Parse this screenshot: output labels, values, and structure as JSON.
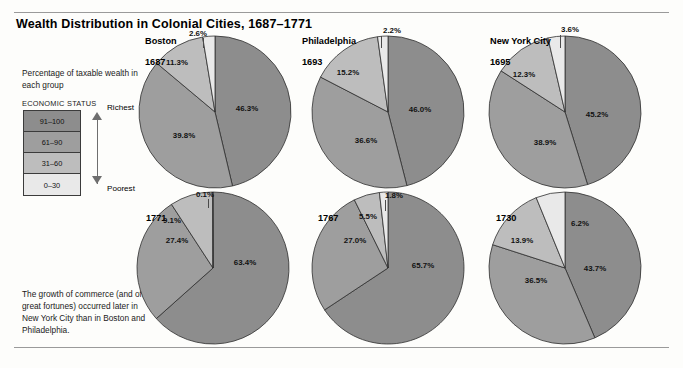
{
  "figure": {
    "title": "Wealth Distribution in Colonial Cities, 1687–1771",
    "key_caption": "Percentage of taxable wealth in each group",
    "key_heading": "ECONOMIC STATUS",
    "axis_top_label": "Richest",
    "axis_bottom_label": "Poorest",
    "footnote": "The growth of commerce (and of great fortunes) occurred later in New York City than in Boston and Philadelphia."
  },
  "legend": {
    "tiers": [
      {
        "label": "91–100",
        "color": "#8d8d8d"
      },
      {
        "label": "61–90",
        "color": "#9e9e9e"
      },
      {
        "label": "31–60",
        "color": "#bdbdbd"
      },
      {
        "label": "0–30",
        "color": "#e9e9e9"
      }
    ]
  },
  "chart_data": [
    {
      "type": "pie",
      "title": "Boston",
      "subtitle": "1687",
      "city": "Boston",
      "year": "1687",
      "categories": [
        "91–100",
        "61–90",
        "31–60",
        "0–30"
      ],
      "values": [
        46.3,
        39.8,
        11.3,
        2.6
      ],
      "labels": [
        "46.3%",
        "39.8%",
        "11.3%",
        "2.6%"
      ],
      "colors": [
        "#8d8d8d",
        "#9e9e9e",
        "#bdbdbd",
        "#e9e9e9"
      ]
    },
    {
      "type": "pie",
      "title": "Philadelphia",
      "subtitle": "1693",
      "city": "Philadelphia",
      "year": "1693",
      "categories": [
        "91–100",
        "61–90",
        "31–60",
        "0–30"
      ],
      "values": [
        46.0,
        36.6,
        15.2,
        2.2
      ],
      "labels": [
        "46.0%",
        "36.6%",
        "15.2%",
        "2.2%"
      ],
      "colors": [
        "#8d8d8d",
        "#9e9e9e",
        "#bdbdbd",
        "#e9e9e9"
      ]
    },
    {
      "type": "pie",
      "title": "New York City",
      "subtitle": "1695",
      "city": "New York City",
      "year": "1695",
      "categories": [
        "91–100",
        "61–90",
        "31–60",
        "0–30"
      ],
      "values": [
        45.2,
        38.9,
        12.3,
        3.6
      ],
      "labels": [
        "45.2%",
        "38.9%",
        "12.3%",
        "3.6%"
      ],
      "colors": [
        "#8d8d8d",
        "#9e9e9e",
        "#bdbdbd",
        "#e9e9e9"
      ]
    },
    {
      "type": "pie",
      "title": "Boston",
      "subtitle": "1771",
      "city": "",
      "year": "1771",
      "categories": [
        "91–100",
        "61–90",
        "31–60",
        "0–30"
      ],
      "values": [
        63.4,
        27.4,
        9.1,
        0.1
      ],
      "labels": [
        "63.4%",
        "27.4%",
        "9.1%",
        "0.1%"
      ],
      "colors": [
        "#8d8d8d",
        "#9e9e9e",
        "#bdbdbd",
        "#e9e9e9"
      ]
    },
    {
      "type": "pie",
      "title": "Philadelphia",
      "subtitle": "1767",
      "city": "",
      "year": "1767",
      "categories": [
        "91–100",
        "61–90",
        "31–60",
        "0–30"
      ],
      "values": [
        65.7,
        27.0,
        5.5,
        1.8
      ],
      "labels": [
        "65.7%",
        "27.0%",
        "5.5%",
        "1.8%"
      ],
      "colors": [
        "#8d8d8d",
        "#9e9e9e",
        "#bdbdbd",
        "#e9e9e9"
      ]
    },
    {
      "type": "pie",
      "title": "New York City",
      "subtitle": "1730",
      "city": "",
      "year": "1730",
      "categories": [
        "91–100",
        "61–90",
        "31–60",
        "0–30"
      ],
      "values": [
        43.7,
        36.5,
        13.9,
        6.2
      ],
      "labels": [
        "43.7%",
        "36.5%",
        "13.9%",
        "6.2%"
      ],
      "colors": [
        "#8d8d8d",
        "#9e9e9e",
        "#bdbdbd",
        "#e9e9e9"
      ]
    }
  ],
  "layout": {
    "pies": [
      {
        "cx": 215,
        "cy": 112,
        "r": 76,
        "start_angle": 0,
        "city_pos": [
          145,
          36
        ],
        "year_pos": [
          145,
          57
        ],
        "label_pos": [
          [
            247,
            108
          ],
          [
            184,
            135
          ],
          [
            177,
            62
          ],
          [
            198,
            33
          ]
        ],
        "leader": {
          "x": 203,
          "y": 38,
          "h": 10
        }
      },
      {
        "cx": 388,
        "cy": 112,
        "r": 76,
        "start_angle": 0,
        "city_pos": [
          302,
          36
        ],
        "year_pos": [
          302,
          57
        ],
        "label_pos": [
          [
            420,
            109
          ],
          [
            366,
            140
          ],
          [
            348,
            72
          ],
          [
            392,
            30
          ]
        ],
        "leader": {
          "x": 381,
          "y": 36,
          "h": 12
        }
      },
      {
        "cx": 565,
        "cy": 112,
        "r": 76,
        "start_angle": 0,
        "city_pos": [
          490,
          36
        ],
        "year_pos": [
          490,
          57
        ],
        "label_pos": [
          [
            597,
            114
          ],
          [
            545,
            142
          ],
          [
            524,
            74
          ],
          [
            570,
            29
          ]
        ],
        "leader": {
          "x": 560,
          "y": 35,
          "h": 13
        }
      },
      {
        "cx": 213,
        "cy": 268,
        "r": 76,
        "start_angle": 0,
        "city_pos": [
          143,
          196
        ],
        "year_pos": [
          146,
          213
        ],
        "label_pos": [
          [
            245,
            262
          ],
          [
            177,
            240
          ],
          [
            172,
            220
          ],
          [
            205,
            194
          ]
        ],
        "leader": {
          "x": 208,
          "y": 199,
          "h": 9
        }
      },
      {
        "cx": 388,
        "cy": 268,
        "r": 76,
        "start_angle": 0,
        "city_pos": [
          318,
          196
        ],
        "year_pos": [
          318,
          213
        ],
        "label_pos": [
          [
            423,
            265
          ],
          [
            355,
            240
          ],
          [
            368,
            216
          ],
          [
            394,
            195
          ]
        ],
        "leader": {
          "x": 385,
          "y": 200,
          "h": 11
        }
      },
      {
        "cx": 565,
        "cy": 268,
        "r": 76,
        "start_angle": 0,
        "city_pos": [
          493,
          196
        ],
        "year_pos": [
          496,
          213
        ],
        "label_pos": [
          [
            595,
            268
          ],
          [
            536,
            280
          ],
          [
            522,
            240
          ],
          [
            580,
            223
          ]
        ],
        "leader": null
      }
    ]
  }
}
